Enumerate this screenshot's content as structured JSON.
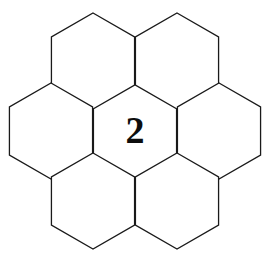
{
  "figure": {
    "type": "hexagon-tiling",
    "background_color": "#ffffff",
    "stroke_color": "#1a1a1a",
    "stroke_width": 1.3,
    "label_color": "#0d0d0d",
    "orientation": "pointy-top",
    "cell_count": 7,
    "canvas": {
      "width": 270,
      "height": 265
    },
    "geometry": {
      "circumradius": 48,
      "cell_width": 84,
      "cell_height": 93,
      "column_spacing": 42,
      "row_spacing": 70
    },
    "cells": [
      {
        "id": "center",
        "label": "2",
        "cx": 135,
        "cy": 131,
        "has_label": true
      },
      {
        "id": "upper-left",
        "label": "",
        "cx": 93,
        "cy": 61,
        "has_label": false
      },
      {
        "id": "upper-right",
        "label": "",
        "cx": 177,
        "cy": 61,
        "has_label": false
      },
      {
        "id": "left",
        "label": "",
        "cx": 51,
        "cy": 131,
        "has_label": false
      },
      {
        "id": "right",
        "label": "",
        "cx": 219,
        "cy": 131,
        "has_label": false
      },
      {
        "id": "lower-left",
        "label": "",
        "cx": 93,
        "cy": 201,
        "has_label": false
      },
      {
        "id": "lower-right",
        "label": "",
        "cx": 177,
        "cy": 201,
        "has_label": false
      }
    ]
  }
}
